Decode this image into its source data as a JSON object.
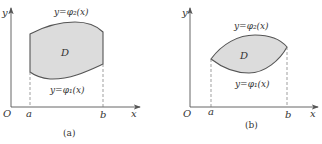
{
  "figure": {
    "colors": {
      "axis": "#555555",
      "boundary": "#555555",
      "fill": "#dcdcdc",
      "dash": "#777777",
      "text": "#333333"
    },
    "panels": [
      {
        "caption": "(a)",
        "origin_label": "O",
        "x_axis_label": "x",
        "y_axis_label": "y",
        "a_label": "a",
        "b_label": "b",
        "region_label": "D",
        "upper_curve_label": "y=φ₂(x)",
        "lower_curve_label": "y=φ₁(x)"
      },
      {
        "caption": "(b)",
        "origin_label": "O",
        "x_axis_label": "x",
        "y_axis_label": "y",
        "a_label": "a",
        "b_label": "b",
        "region_label": "D",
        "upper_curve_label": "y=φ₂(x)",
        "lower_curve_label": "y=φ₁(x)"
      }
    ]
  }
}
